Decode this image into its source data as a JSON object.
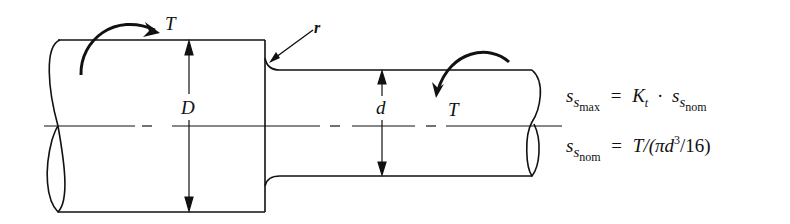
{
  "diagram": {
    "type": "stepped-shaft-torsion",
    "labels": {
      "torque_left": "T",
      "torque_right": "T",
      "fillet_radius": "r",
      "large_diameter": "D",
      "small_diameter": "d"
    },
    "equations": {
      "eq1": {
        "lhs_var": "s",
        "lhs_sub": "s",
        "lhs_subsub": "max",
        "equals": "=",
        "rhs_k": "K",
        "rhs_k_sub": "t",
        "rhs_dot": "·",
        "rhs_var": "s",
        "rhs_sub": "s",
        "rhs_subsub": "nom"
      },
      "eq2": {
        "lhs_var": "s",
        "lhs_sub": "s",
        "lhs_subsub": "nom",
        "equals": "=",
        "rhs_pre": "T/(πd",
        "rhs_exp": "3",
        "rhs_post": "/16)"
      }
    },
    "colors": {
      "stroke": "#111111",
      "background": "#ffffff"
    }
  }
}
